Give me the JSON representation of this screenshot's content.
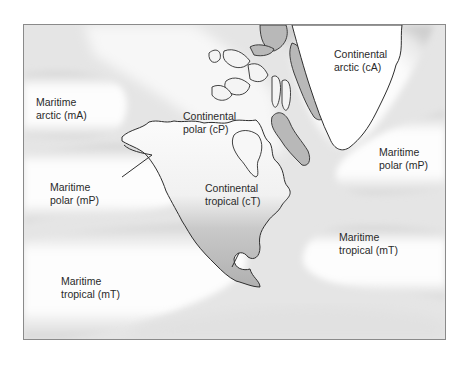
{
  "map": {
    "title": "North American air masses",
    "colors": {
      "background": "#e6e6e6",
      "air_mass_fill": "#ffffff",
      "land_shaded": "#b4b4b4",
      "coastline": "#2e2e2e",
      "frame_border": "#8a8a8a",
      "label_text": "#2a2a2a"
    },
    "air_masses": [
      {
        "id": "mA",
        "line1": "Maritime",
        "line2": "arctic (mA)"
      },
      {
        "id": "cA",
        "line1": "Continental",
        "line2": "arctic (cA)"
      },
      {
        "id": "cP",
        "line1": "Continental",
        "line2": "polar (cP)"
      },
      {
        "id": "mP-pacific",
        "line1": "Maritime",
        "line2": "polar (mP)"
      },
      {
        "id": "mP-atlantic",
        "line1": "Maritime",
        "line2": "polar (mP)"
      },
      {
        "id": "cT",
        "line1": "Continental",
        "line2": "tropical (cT)"
      },
      {
        "id": "mT-atlantic",
        "line1": "Maritime",
        "line2": "tropical (mT)"
      },
      {
        "id": "mT-pacific",
        "line1": "Maritime",
        "line2": "tropical (mT)"
      }
    ]
  }
}
